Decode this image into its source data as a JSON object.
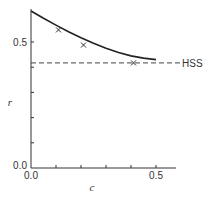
{
  "chart_data": {
    "type": "line",
    "title": "",
    "xlabel": "c",
    "ylabel": "r",
    "xlim": [
      0.0,
      0.58
    ],
    "ylim": [
      0.0,
      0.63
    ],
    "grid": false,
    "legend": null,
    "x_ticks": [
      0.0,
      0.1,
      0.2,
      0.3,
      0.4,
      0.5
    ],
    "x_tick_labels": [
      "0.0",
      "",
      "",
      "",
      "",
      "0.5"
    ],
    "y_ticks": [
      0.0,
      0.1,
      0.2,
      0.3,
      0.4,
      0.5
    ],
    "y_tick_labels": [
      "0.0",
      "",
      "",
      "",
      "",
      "0.5"
    ],
    "series": [
      {
        "name": "model curve",
        "style": "solid",
        "color": "#222222",
        "x": [
          0.0,
          0.05,
          0.1,
          0.15,
          0.2,
          0.25,
          0.3,
          0.35,
          0.4,
          0.45,
          0.5
        ],
        "values": [
          0.623,
          0.594,
          0.567,
          0.541,
          0.517,
          0.495,
          0.475,
          0.458,
          0.445,
          0.436,
          0.43
        ]
      },
      {
        "name": "data points",
        "style": "marker-x",
        "color": "#333333",
        "x": [
          0.11,
          0.21,
          0.41
        ],
        "values": [
          0.548,
          0.488,
          0.417
        ]
      }
    ],
    "reference_lines": [
      {
        "label": "HSS",
        "orientation": "horizontal",
        "style": "dashed",
        "y": 0.417
      }
    ]
  },
  "labels": {
    "x_axis": "c",
    "y_axis": "r",
    "x_tick_0": "0.0",
    "x_tick_05": "0.5",
    "y_tick_0": "0.0",
    "y_tick_05": "0.5",
    "hss": "HSS"
  }
}
